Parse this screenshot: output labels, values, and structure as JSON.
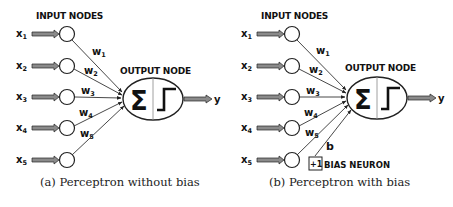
{
  "panels": [
    {
      "id": "a",
      "offset_x": 0,
      "input_header": "INPUT NODES",
      "output_header": "OUTPUT NODE",
      "inputs": [
        {
          "label": "x",
          "sub": "1",
          "weight": "w",
          "wsub": "1",
          "y": 34
        },
        {
          "label": "x",
          "sub": "2",
          "weight": "w",
          "wsub": "2",
          "y": 66
        },
        {
          "label": "x",
          "sub": "3",
          "weight": "w",
          "wsub": "3",
          "y": 97
        },
        {
          "label": "x",
          "sub": "4",
          "weight": "w",
          "wsub": "4",
          "y": 128
        },
        {
          "label": "x",
          "sub": "5",
          "weight": "w",
          "wsub": "5",
          "y": 160
        }
      ],
      "sum_symbol": "Σ",
      "output_label": "y",
      "has_bias": false,
      "caption": "(a) Perceptron without bias"
    },
    {
      "id": "b",
      "offset_x": 225,
      "input_header": "INPUT NODES",
      "output_header": "OUTPUT NODE",
      "inputs": [
        {
          "label": "x",
          "sub": "1",
          "weight": "w",
          "wsub": "1",
          "y": 34
        },
        {
          "label": "x",
          "sub": "2",
          "weight": "w",
          "wsub": "2",
          "y": 66
        },
        {
          "label": "x",
          "sub": "3",
          "weight": "w",
          "wsub": "3",
          "y": 97
        },
        {
          "label": "x",
          "sub": "4",
          "weight": "w",
          "wsub": "4",
          "y": 128
        },
        {
          "label": "x",
          "sub": "5",
          "weight": "w",
          "wsub": "5",
          "y": 160
        }
      ],
      "sum_symbol": "Σ",
      "output_label": "y",
      "has_bias": true,
      "bias": {
        "value": "+1",
        "label": "BIAS NEURON",
        "weight": "b"
      },
      "caption": "(b) Perceptron with bias"
    }
  ],
  "colors": {
    "stroke": "#222222",
    "arrow_fill": "#8a8a8a",
    "divider": "#888888"
  }
}
